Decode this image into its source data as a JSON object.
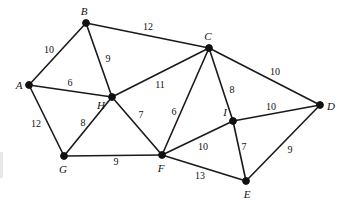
{
  "figure": {
    "kind": "weighted-undirected-graph",
    "background_color": "#ffffff",
    "ink_color": "#111111",
    "width": 343,
    "height": 205
  },
  "nodes": [
    {
      "id": "A",
      "label": "A",
      "x": 29,
      "y": 85,
      "label_x": 19,
      "label_y": 85
    },
    {
      "id": "B",
      "label": "B",
      "x": 86,
      "y": 23,
      "label_x": 84,
      "label_y": 11
    },
    {
      "id": "C",
      "label": "C",
      "x": 209,
      "y": 48,
      "label_x": 208,
      "label_y": 36
    },
    {
      "id": "D",
      "label": "D",
      "x": 320,
      "y": 105,
      "label_x": 331,
      "label_y": 106
    },
    {
      "id": "E",
      "label": "E",
      "x": 246,
      "y": 181,
      "label_x": 247,
      "label_y": 194
    },
    {
      "id": "F",
      "label": "F",
      "x": 162,
      "y": 155,
      "label_x": 161,
      "label_y": 168
    },
    {
      "id": "G",
      "label": "G",
      "x": 64,
      "y": 156,
      "label_x": 63,
      "label_y": 169
    },
    {
      "id": "H",
      "label": "H",
      "x": 112,
      "y": 97,
      "label_x": 101,
      "label_y": 105
    },
    {
      "id": "I",
      "label": "I",
      "x": 233,
      "y": 121,
      "label_x": 225,
      "label_y": 112
    }
  ],
  "edges": [
    {
      "from": "A",
      "to": "B",
      "weight": "10",
      "label_x": 49,
      "label_y": 50
    },
    {
      "from": "B",
      "to": "C",
      "weight": "12",
      "label_x": 148,
      "label_y": 27
    },
    {
      "from": "B",
      "to": "H",
      "weight": "9",
      "label_x": 108,
      "label_y": 59
    },
    {
      "from": "A",
      "to": "H",
      "weight": "6",
      "label_x": 70,
      "label_y": 83
    },
    {
      "from": "A",
      "to": "G",
      "weight": "12",
      "label_x": 36,
      "label_y": 124
    },
    {
      "from": "G",
      "to": "H",
      "weight": "8",
      "label_x": 83,
      "label_y": 123
    },
    {
      "from": "G",
      "to": "F",
      "weight": "9",
      "label_x": 116,
      "label_y": 162
    },
    {
      "from": "H",
      "to": "F",
      "weight": "7",
      "label_x": 141,
      "label_y": 115
    },
    {
      "from": "H",
      "to": "C",
      "weight": "11",
      "label_x": 160,
      "label_y": 85
    },
    {
      "from": "C",
      "to": "F",
      "weight": "6",
      "label_x": 174,
      "label_y": 112
    },
    {
      "from": "C",
      "to": "I",
      "weight": "8",
      "label_x": 232,
      "label_y": 90
    },
    {
      "from": "C",
      "to": "D",
      "weight": "10",
      "label_x": 275,
      "label_y": 72
    },
    {
      "from": "I",
      "to": "D",
      "weight": "10",
      "label_x": 271,
      "label_y": 107
    },
    {
      "from": "I",
      "to": "F",
      "weight": "10",
      "label_x": 203,
      "label_y": 147
    },
    {
      "from": "I",
      "to": "E",
      "weight": "7",
      "label_x": 244,
      "label_y": 147
    },
    {
      "from": "F",
      "to": "E",
      "weight": "13",
      "label_x": 200,
      "label_y": 176
    },
    {
      "from": "E",
      "to": "D",
      "weight": "9",
      "label_x": 290,
      "label_y": 150
    }
  ]
}
